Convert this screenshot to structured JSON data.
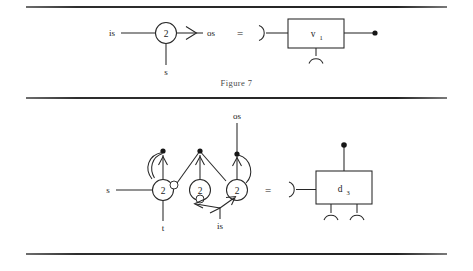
{
  "document": {
    "type": "scanned-paper-page",
    "background_color": "#ffffff",
    "ink_color": "#1a1a1a"
  },
  "rules": [
    {
      "name": "top-rule"
    },
    {
      "name": "middle-rule"
    },
    {
      "name": "bottom-rule"
    }
  ],
  "figures": [
    {
      "caption": "Figure 7",
      "left_diagram": {
        "kind": "petri-net",
        "input_label": "is",
        "output_label": "os",
        "bottom_label": "s",
        "node_label": "2"
      },
      "equals_sign": "=",
      "right_diagram": {
        "kind": "block-symbol",
        "box_label": "v",
        "box_subscript": "1"
      }
    },
    {
      "caption": "Figure 8",
      "left_diagram": {
        "kind": "petri-net",
        "input_label": "s",
        "bottom_left_label": "t",
        "bottom_mid_label": "is",
        "top_label": "os",
        "node_labels": [
          "2",
          "2",
          "2"
        ]
      },
      "equals_sign": "=",
      "right_diagram": {
        "kind": "block-symbol",
        "box_label": "d",
        "box_subscript": "3"
      }
    }
  ]
}
